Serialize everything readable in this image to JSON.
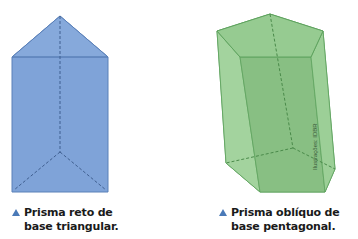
{
  "figures": [
    {
      "name": "triangular-prism",
      "caption_line1": "Prisma reto de",
      "caption_line2": "base triangular.",
      "fill": "#7fa3d8",
      "stroke": "#5078b0"
    },
    {
      "name": "pentagonal-prism",
      "caption_line1": "Prisma oblíquo de",
      "caption_line2": "base pentagonal.",
      "fill": "#8cc487",
      "stroke": "#4f9a4f"
    }
  ],
  "credit": "Ilustrações: IDBR",
  "marker_color": "#4a7ab8"
}
